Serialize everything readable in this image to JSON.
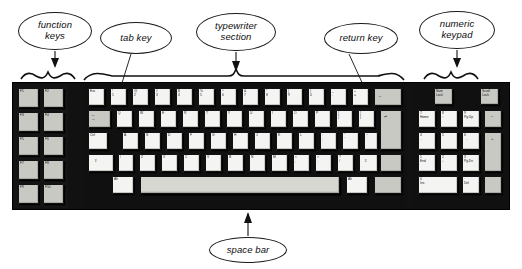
{
  "figure": {
    "background_color": "#ffffff",
    "ink_color": "#111111",
    "key_face_color": "#f4f4f2",
    "key_gray_color": "#c9c9c4",
    "chassis_color": "#111111"
  },
  "callouts": [
    {
      "id": "function-keys",
      "text": "function\nkeys",
      "line1": "function",
      "line2": "keys",
      "pointer": "brace-down"
    },
    {
      "id": "tab-key",
      "text": "tab key",
      "line1": "tab key",
      "line2": "",
      "pointer": "line-down-right"
    },
    {
      "id": "typewriter-section",
      "text": "typewriter\nsection",
      "line1": "typewriter",
      "line2": "section",
      "pointer": "brace-down"
    },
    {
      "id": "return-key",
      "text": "return key",
      "line1": "return key",
      "line2": "",
      "pointer": "line-down-right"
    },
    {
      "id": "numeric-keypad",
      "text": "numeric\nkeypad",
      "line1": "numeric",
      "line2": "keypad",
      "pointer": "brace-down"
    },
    {
      "id": "space-bar",
      "text": "space bar",
      "line1": "space bar",
      "line2": "",
      "pointer": "line-up"
    }
  ],
  "function_keys": {
    "rows": [
      [
        "F1",
        "F2"
      ],
      [
        "F3",
        "F4"
      ],
      [
        "F5",
        "F6"
      ],
      [
        "F7",
        "F8"
      ],
      [
        "F9",
        "F10"
      ]
    ]
  },
  "typewriter_section": {
    "row_number": [
      "Esc",
      "!\n1",
      "@\n2",
      "#\n3",
      "$\n4",
      "%\n5",
      "^\n6",
      "&\n7",
      "*\n8",
      "(\n9",
      ")\n0",
      "_\n-",
      "+\n=",
      "←"
    ],
    "row_qwerty": [
      "←\n→",
      "Q",
      "W",
      "E",
      "R",
      "T",
      "Y",
      "U",
      "I",
      "O",
      "P",
      "{\n[",
      "}\n]",
      "|\n\\"
    ],
    "row_home": [
      "Ctrl",
      "A",
      "S",
      "D",
      "F",
      "G",
      "H",
      "J",
      "K",
      "L",
      ":\n;",
      "\"\n'",
      "~\n`",
      "↵"
    ],
    "row_shift": [
      "⇧",
      "\\",
      "Z",
      "X",
      "C",
      "V",
      "B",
      "N",
      "M",
      "<\n,",
      ">\n.",
      "?\n/",
      "⇧"
    ],
    "row_bottom": [
      "Alt",
      "space",
      "Alt"
    ],
    "tab_key_label": "←\n→",
    "backspace_label": "←",
    "return_label": "↵",
    "space_label": ""
  },
  "numeric_keypad": {
    "top_row": [
      "Num\nLock",
      "Scroll\nLock"
    ],
    "grid": [
      [
        "7\nHome",
        "8\n↑",
        "9\nPg Up",
        "−"
      ],
      [
        "4\n←",
        "5",
        "6\n→",
        ""
      ],
      [
        "1\nEnd",
        "2\n↓",
        "3\nPg Dn",
        "+"
      ],
      [
        "0\nIns",
        "",
        "·\nDel",
        ""
      ]
    ],
    "labels": {
      "num_lock": "Num\nLock",
      "scroll_lock": "Scroll\nLock",
      "minus": "−",
      "plus": "+",
      "zero": "0\nIns",
      "del": "·\nDel"
    }
  }
}
